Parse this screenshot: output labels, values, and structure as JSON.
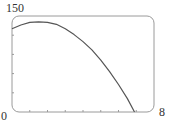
{
  "chart_data": {
    "type": "line",
    "title": "",
    "xlabel": "",
    "ylabel": "",
    "xlim": [
      0,
      8
    ],
    "ylim": [
      0,
      150
    ],
    "tick_labels": {
      "x_min": "0",
      "x_max": "8",
      "y_max": "150"
    },
    "x_ticks": [
      0,
      1,
      2,
      3,
      4,
      5,
      6,
      7,
      8
    ],
    "y_ticks": [
      0,
      30,
      60,
      90,
      120,
      150
    ],
    "grid": false,
    "legend": null,
    "series": [
      {
        "name": "curve",
        "x": [
          0,
          0.5,
          1,
          1.5,
          2,
          2.5,
          3,
          3.5,
          4,
          4.5,
          5,
          5.5,
          6,
          6.5,
          6.9
        ],
        "y": [
          130,
          136,
          140,
          141,
          140,
          137,
          130,
          121,
          110,
          97,
          81,
          63,
          43,
          21,
          0
        ]
      }
    ],
    "colors": {
      "frame": "#9a9a9a",
      "curve": "#555555",
      "text": "#333333"
    }
  }
}
